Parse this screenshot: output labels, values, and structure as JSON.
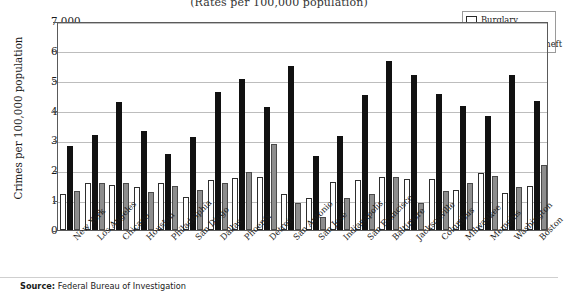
{
  "chart": {
    "title": "(Rates per 100,000 population)",
    "ylabel": "Crimes per 100,000 population",
    "source_prefix": "Source:",
    "source_text": " Federal Bureau of Investigation"
  },
  "legend": {
    "items": [
      {
        "label": "Burglary",
        "color": "#ffffff",
        "swatch": "sw-burglary"
      },
      {
        "label": "Larceny",
        "color": "#111111",
        "swatch": "sw-larceny"
      },
      {
        "label": "Motor-vehicle theft",
        "color": "#8d8d8d",
        "swatch": "sw-mvt"
      }
    ]
  },
  "chart_data": {
    "type": "bar",
    "title": "(Rates per 100,000 population)",
    "xlabel": "",
    "ylabel": "Crimes per 100,000 population",
    "ylim": [
      0,
      7000
    ],
    "yticks": [
      0,
      1000,
      2000,
      3000,
      4000,
      5000,
      6000,
      7000
    ],
    "ytick_labels": [
      "0",
      "1,000",
      "2,000",
      "3,000",
      "4,000",
      "5,000",
      "6,000",
      "7,000"
    ],
    "grid": true,
    "legend_position": "top-right",
    "categories": [
      "New York",
      "Los Angeles",
      "Chicago",
      "Houston",
      "Philadelphia",
      "San Diego",
      "Dallas",
      "Phoenix",
      "Detroit",
      "San Antonio",
      "San Jose",
      "Indianapolis",
      "San Francisco",
      "Baltimore",
      "Jacksonville",
      "Columbus",
      "Milwaukee",
      "Memphis",
      "Washington",
      "Boston"
    ],
    "series": [
      {
        "name": "Burglary",
        "color": "#ffffff",
        "values": [
          1220,
          1560,
          1510,
          1450,
          1570,
          1120,
          1680,
          1750,
          1760,
          1220,
          1060,
          1620,
          1660,
          1760,
          1700,
          1700,
          1330,
          1900,
          1230,
          1480
        ]
      },
      {
        "name": "Larceny",
        "color": "#111111",
        "values": [
          2820,
          3180,
          4280,
          3300,
          2560,
          3120,
          4620,
          5060,
          4120,
          5480,
          2470,
          3150,
          4530,
          5650,
          5200,
          4540,
          4160,
          3810,
          5180,
          4310
        ]
      },
      {
        "name": "Motor-vehicle theft",
        "color": "#8d8d8d",
        "values": [
          1320,
          1560,
          1570,
          1270,
          1470,
          1350,
          1570,
          1930,
          2890,
          900,
          430,
          1080,
          1190,
          1780,
          920,
          1290,
          1580,
          1810,
          1450,
          2180
        ]
      }
    ]
  }
}
